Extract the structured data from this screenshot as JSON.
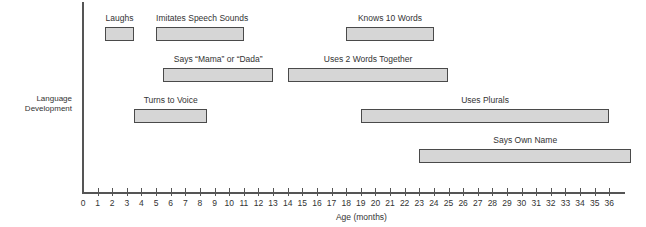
{
  "chart_data": {
    "type": "bar",
    "subtype": "horizontal-range (gantt)",
    "title": "",
    "ylabel": "Language Development",
    "xlabel": "Age  (months)",
    "xlim": [
      0,
      36
    ],
    "x_ticks": [
      0,
      1,
      2,
      3,
      4,
      5,
      6,
      7,
      8,
      9,
      10,
      11,
      12,
      13,
      14,
      15,
      16,
      17,
      18,
      19,
      20,
      21,
      22,
      23,
      24,
      25,
      26,
      27,
      28,
      29,
      30,
      31,
      32,
      33,
      34,
      35,
      36
    ],
    "grid": false,
    "legend": null,
    "colors": {
      "bar_fill": "#d6d6d6",
      "bar_border": "#4a4a4a",
      "axis": "#555555"
    },
    "series": [
      {
        "name": "Laughs",
        "start": 1.5,
        "end": 3.5,
        "row": 0
      },
      {
        "name": "Imitates Speech Sounds",
        "start": 5,
        "end": 11,
        "row": 0
      },
      {
        "name": "Knows 10 Words",
        "start": 18,
        "end": 24,
        "row": 0
      },
      {
        "name": "Says ''Mama'' or ''Dada''",
        "start": 5.5,
        "end": 13,
        "row": 1
      },
      {
        "name": "Uses  2  Words  Together",
        "start": 14,
        "end": 25,
        "row": 1
      },
      {
        "name": "Turns  to  Voice",
        "start": 3.5,
        "end": 8.5,
        "row": 2
      },
      {
        "name": "Uses Plurals",
        "start": 19,
        "end": 36,
        "row": 2
      },
      {
        "name": "Says Own Name",
        "start": 23,
        "end": 37.5,
        "row": 3
      }
    ]
  },
  "labels": {
    "ylabel_line1": "Language",
    "ylabel_line2": "Development",
    "xlabel": "Age  (months)"
  }
}
